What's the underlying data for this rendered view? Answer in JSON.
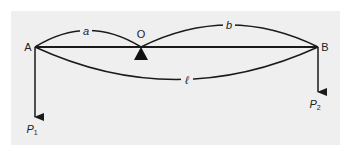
{
  "diagram": {
    "type": "beam-lever",
    "colors": {
      "background": "#efefef",
      "stroke": "#1a1a1a",
      "text": "#222222"
    },
    "points": {
      "A": {
        "label": "A"
      },
      "O": {
        "label": "O"
      },
      "B": {
        "label": "B"
      }
    },
    "dimensions": {
      "a": {
        "label": "a",
        "from": "A",
        "to": "O"
      },
      "b": {
        "label": "b",
        "from": "O",
        "to": "B"
      },
      "l": {
        "label": "ℓ",
        "from": "A",
        "to": "B"
      }
    },
    "forces": {
      "P1": {
        "base": "P",
        "sub": "1",
        "at": "A",
        "direction": "down"
      },
      "P2": {
        "base": "P",
        "sub": "2",
        "at": "B",
        "direction": "down"
      }
    },
    "support": {
      "type": "pivot-triangle",
      "at": "O"
    }
  }
}
